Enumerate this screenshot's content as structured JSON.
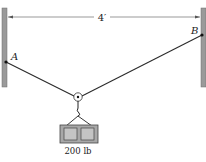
{
  "diagram": {
    "type": "statics-pulley",
    "dimension_label": "4′",
    "points": {
      "A": {
        "label": "A"
      },
      "B": {
        "label": "B"
      }
    },
    "load_label": "200 lb",
    "caption": "",
    "colors": {
      "wall": "#9a9a9a",
      "wall_edge": "#6e6e6e",
      "cable": "#2a2a2a",
      "crate_fill": "#a8a8a8",
      "crate_inner": "#c4c4c4",
      "dimension_line": "#555555"
    }
  }
}
